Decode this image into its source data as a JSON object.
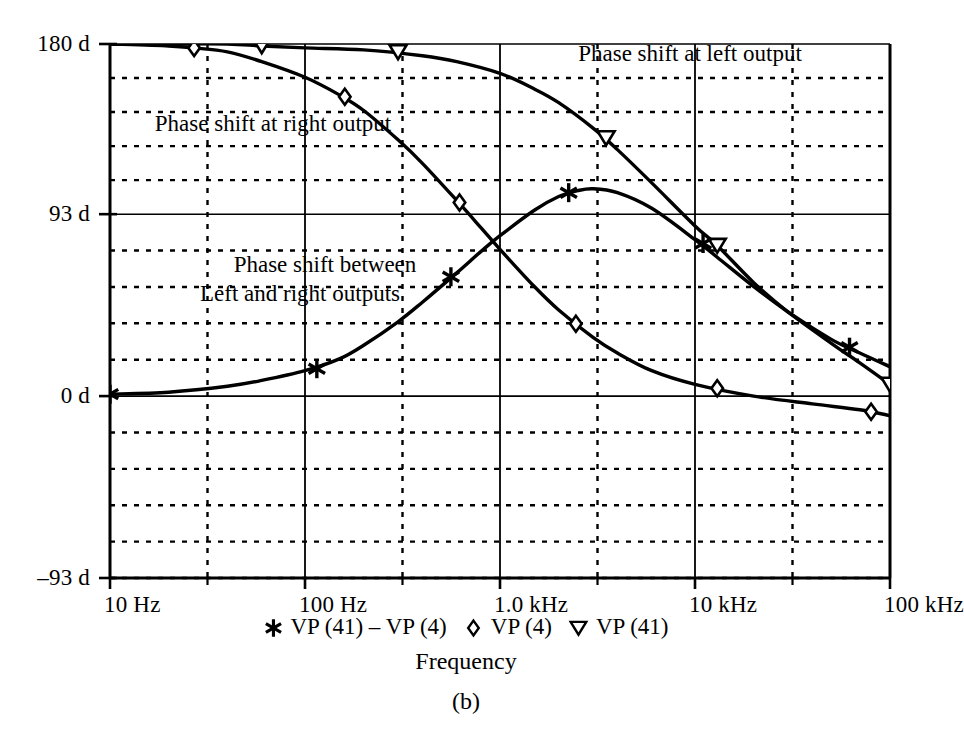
{
  "figure": {
    "caption": "(b)",
    "axis_title": "Frequency"
  },
  "annotations": [
    {
      "text": "Phase shift at left output",
      "x": 690,
      "y": 40
    },
    {
      "text": "Phase shift at right output",
      "x": 273,
      "y": 110
    },
    {
      "text": "Phase shift between",
      "x": 325,
      "y": 251
    },
    {
      "text": "Left and right outputs",
      "x": 300,
      "y": 280
    }
  ],
  "legend": [
    {
      "marker": "asterisk-marker",
      "label": "VP (41) – VP (4)"
    },
    {
      "marker": "diamond-marker",
      "label": "VP (4)"
    },
    {
      "marker": "triangle-down-marker",
      "label": "VP (41)"
    }
  ],
  "chart_data": {
    "type": "line",
    "title": "",
    "xlabel": "Frequency",
    "ylabel": "",
    "xscale": "log",
    "xlim": [
      10,
      100000
    ],
    "ylim": [
      -93,
      180
    ],
    "grid": true,
    "legend_position": "bottom",
    "x_ticks": [
      {
        "value": 10,
        "label": "10 Hz"
      },
      {
        "value": 100,
        "label": "100 Hz"
      },
      {
        "value": 1000,
        "label": "1.0 kHz"
      },
      {
        "value": 10000,
        "label": "10 kHz"
      },
      {
        "value": 100000,
        "label": "100 kHz"
      }
    ],
    "y_ticks": [
      {
        "value": 180,
        "label": "180 d"
      },
      {
        "value": 93,
        "label": "93 d"
      },
      {
        "value": 0,
        "label": "0 d"
      },
      {
        "value": -93,
        "label": "–93 d"
      }
    ],
    "y_minor_divisions_per_major": 5,
    "series": [
      {
        "name": "VP (41)",
        "marker": "triangle-down-marker",
        "description": "Phase shift at left output",
        "points": [
          {
            "x": 10,
            "y": 180
          },
          {
            "x": 20,
            "y": 180
          },
          {
            "x": 40,
            "y": 180
          },
          {
            "x": 60,
            "y": 179
          },
          {
            "x": 100,
            "y": 178
          },
          {
            "x": 200,
            "y": 177
          },
          {
            "x": 400,
            "y": 174
          },
          {
            "x": 600,
            "y": 171
          },
          {
            "x": 1000,
            "y": 165
          },
          {
            "x": 1500,
            "y": 157
          },
          {
            "x": 2000,
            "y": 150
          },
          {
            "x": 3000,
            "y": 137
          },
          {
            "x": 4000,
            "y": 126
          },
          {
            "x": 6000,
            "y": 109
          },
          {
            "x": 10000,
            "y": 87
          },
          {
            "x": 13000,
            "y": 77
          },
          {
            "x": 20000,
            "y": 58
          },
          {
            "x": 30000,
            "y": 43
          },
          {
            "x": 50000,
            "y": 27
          },
          {
            "x": 70000,
            "y": 17
          },
          {
            "x": 100000,
            "y": 6
          }
        ]
      },
      {
        "name": "VP (4)",
        "marker": "diamond-marker",
        "description": "Phase shift at right output",
        "points": [
          {
            "x": 10,
            "y": 180
          },
          {
            "x": 20,
            "y": 179
          },
          {
            "x": 27,
            "y": 178
          },
          {
            "x": 40,
            "y": 176
          },
          {
            "x": 60,
            "y": 171
          },
          {
            "x": 100,
            "y": 163
          },
          {
            "x": 150,
            "y": 154
          },
          {
            "x": 200,
            "y": 146
          },
          {
            "x": 300,
            "y": 131
          },
          {
            "x": 400,
            "y": 119
          },
          {
            "x": 600,
            "y": 100
          },
          {
            "x": 800,
            "y": 86
          },
          {
            "x": 1000,
            "y": 75
          },
          {
            "x": 1500,
            "y": 56
          },
          {
            "x": 2000,
            "y": 44
          },
          {
            "x": 3000,
            "y": 30
          },
          {
            "x": 4000,
            "y": 22
          },
          {
            "x": 6000,
            "y": 13
          },
          {
            "x": 10000,
            "y": 6
          },
          {
            "x": 20000,
            "y": 0
          },
          {
            "x": 40000,
            "y": -4
          },
          {
            "x": 70000,
            "y": -7
          },
          {
            "x": 100000,
            "y": -10
          }
        ]
      },
      {
        "name": "VP (41) – VP (4)",
        "marker": "asterisk-marker",
        "description": "Phase shift between left and right outputs",
        "points": [
          {
            "x": 10,
            "y": 1
          },
          {
            "x": 20,
            "y": 2
          },
          {
            "x": 40,
            "y": 5
          },
          {
            "x": 60,
            "y": 8
          },
          {
            "x": 100,
            "y": 13
          },
          {
            "x": 150,
            "y": 19
          },
          {
            "x": 200,
            "y": 26
          },
          {
            "x": 300,
            "y": 38
          },
          {
            "x": 400,
            "y": 48
          },
          {
            "x": 600,
            "y": 63
          },
          {
            "x": 800,
            "y": 74
          },
          {
            "x": 1000,
            "y": 82
          },
          {
            "x": 1500,
            "y": 95
          },
          {
            "x": 2000,
            "y": 102
          },
          {
            "x": 2500,
            "y": 105
          },
          {
            "x": 3000,
            "y": 106
          },
          {
            "x": 4000,
            "y": 104
          },
          {
            "x": 6000,
            "y": 96
          },
          {
            "x": 10000,
            "y": 80
          },
          {
            "x": 13000,
            "y": 71
          },
          {
            "x": 20000,
            "y": 56
          },
          {
            "x": 30000,
            "y": 43
          },
          {
            "x": 50000,
            "y": 29
          },
          {
            "x": 70000,
            "y": 22
          },
          {
            "x": 100000,
            "y": 15
          }
        ]
      }
    ],
    "markers": {
      "VP (41)": [
        {
          "x": 60,
          "y": 179
        },
        {
          "x": 300,
          "y": 176
        },
        {
          "x": 3500,
          "y": 132
        },
        {
          "x": 13000,
          "y": 77
        },
        {
          "x": 100000,
          "y": 6
        }
      ],
      "VP (4)": [
        {
          "x": 27,
          "y": 178
        },
        {
          "x": 160,
          "y": 153
        },
        {
          "x": 620,
          "y": 99
        },
        {
          "x": 2450,
          "y": 37
        },
        {
          "x": 13000,
          "y": 4
        },
        {
          "x": 80000,
          "y": -8
        }
      ],
      "VP (41) – VP (4)": [
        {
          "x": 10,
          "y": 1
        },
        {
          "x": 115,
          "y": 14
        },
        {
          "x": 560,
          "y": 61
        },
        {
          "x": 2250,
          "y": 104
        },
        {
          "x": 11000,
          "y": 78
        },
        {
          "x": 62000,
          "y": 25
        }
      ]
    }
  }
}
